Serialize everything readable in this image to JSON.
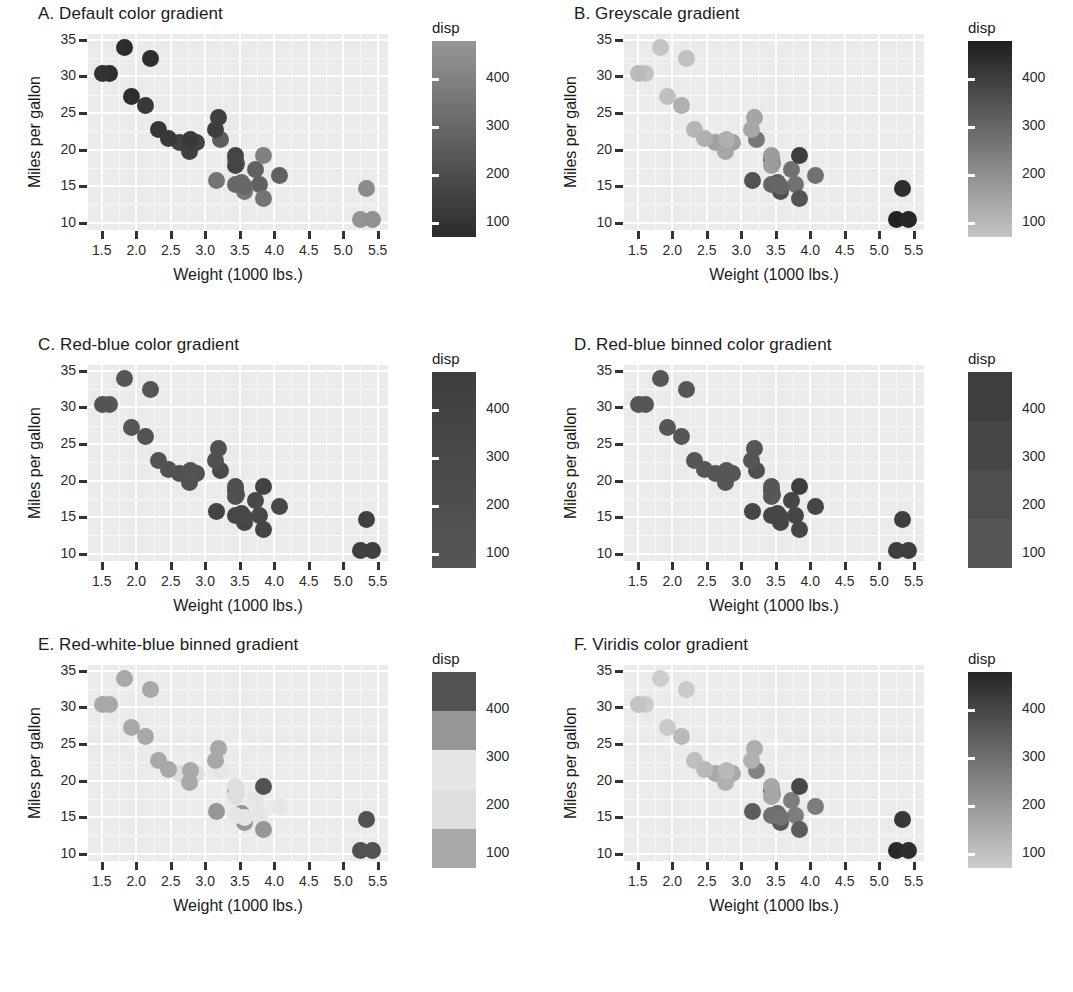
{
  "figure": {
    "axis": {
      "xlabel": "Weight (1000 lbs.)",
      "ylabel": "Miles per gallon",
      "xticks": [
        "1.5",
        "2.0",
        "2.5",
        "3.0",
        "3.5",
        "4.0",
        "4.5",
        "5.0",
        "5.5"
      ],
      "yticks": [
        "10",
        "15",
        "20",
        "25",
        "30",
        "35"
      ],
      "xlim": [
        1.3,
        5.65
      ],
      "ylim": [
        9.0,
        35.8
      ]
    },
    "legend": {
      "title": "disp",
      "labels": [
        "100",
        "200",
        "300",
        "400"
      ],
      "values": [
        100,
        200,
        300,
        400
      ],
      "range": [
        70,
        480
      ]
    },
    "panels": [
      {
        "id": "A",
        "title": "A. Default color gradient",
        "palette": "default-blue",
        "binned": false
      },
      {
        "id": "B",
        "title": "B. Greyscale gradient",
        "palette": "greyscale",
        "binned": false
      },
      {
        "id": "C",
        "title": "C. Red-blue color gradient",
        "palette": "red-blue",
        "binned": false
      },
      {
        "id": "D",
        "title": "D. Red-blue binned color gradient",
        "palette": "red-blue-binned",
        "binned": true
      },
      {
        "id": "E",
        "title": "E. Red-white-blue binned gradient",
        "palette": "red-white-blue-binned",
        "binned": true
      },
      {
        "id": "F",
        "title": "F. Viridis color gradient",
        "palette": "viridis",
        "binned": false
      }
    ]
  },
  "chart_data": {
    "type": "scatter",
    "xlabel": "Weight (1000 lbs.)",
    "ylabel": "Miles per gallon",
    "color_variable": "disp",
    "xlim": [
      1.3,
      5.65
    ],
    "ylim": [
      9.0,
      35.8
    ],
    "grid": true,
    "legend_position": "right",
    "points": [
      {
        "wt": 2.62,
        "mpg": 21.0,
        "disp": 160.0
      },
      {
        "wt": 2.875,
        "mpg": 21.0,
        "disp": 160.0
      },
      {
        "wt": 2.32,
        "mpg": 22.8,
        "disp": 108.0
      },
      {
        "wt": 3.215,
        "mpg": 21.4,
        "disp": 258.0
      },
      {
        "wt": 3.44,
        "mpg": 18.7,
        "disp": 360.0
      },
      {
        "wt": 3.46,
        "mpg": 18.1,
        "disp": 225.0
      },
      {
        "wt": 3.57,
        "mpg": 14.3,
        "disp": 360.0
      },
      {
        "wt": 3.19,
        "mpg": 24.4,
        "disp": 146.7
      },
      {
        "wt": 3.15,
        "mpg": 22.8,
        "disp": 140.8
      },
      {
        "wt": 3.44,
        "mpg": 19.2,
        "disp": 167.6
      },
      {
        "wt": 3.44,
        "mpg": 17.8,
        "disp": 167.6
      },
      {
        "wt": 4.07,
        "mpg": 16.4,
        "disp": 275.8
      },
      {
        "wt": 3.73,
        "mpg": 17.3,
        "disp": 275.8
      },
      {
        "wt": 3.78,
        "mpg": 15.2,
        "disp": 275.8
      },
      {
        "wt": 5.25,
        "mpg": 10.4,
        "disp": 472.0
      },
      {
        "wt": 5.424,
        "mpg": 10.4,
        "disp": 460.0
      },
      {
        "wt": 5.345,
        "mpg": 14.7,
        "disp": 440.0
      },
      {
        "wt": 2.2,
        "mpg": 32.4,
        "disp": 78.7
      },
      {
        "wt": 1.615,
        "mpg": 30.4,
        "disp": 75.7
      },
      {
        "wt": 1.835,
        "mpg": 33.9,
        "disp": 71.1
      },
      {
        "wt": 2.465,
        "mpg": 21.5,
        "disp": 120.1
      },
      {
        "wt": 3.52,
        "mpg": 15.5,
        "disp": 318.0
      },
      {
        "wt": 3.435,
        "mpg": 15.2,
        "disp": 304.0
      },
      {
        "wt": 3.84,
        "mpg": 13.3,
        "disp": 350.0
      },
      {
        "wt": 3.845,
        "mpg": 19.2,
        "disp": 400.0
      },
      {
        "wt": 1.935,
        "mpg": 27.3,
        "disp": 79.0
      },
      {
        "wt": 2.14,
        "mpg": 26.0,
        "disp": 120.3
      },
      {
        "wt": 1.513,
        "mpg": 30.4,
        "disp": 95.1
      },
      {
        "wt": 3.17,
        "mpg": 15.8,
        "disp": 351.0
      },
      {
        "wt": 2.77,
        "mpg": 19.7,
        "disp": 145.0
      },
      {
        "wt": 3.57,
        "mpg": 15.0,
        "disp": 301.0
      },
      {
        "wt": 2.78,
        "mpg": 21.4,
        "disp": 121.0
      }
    ]
  }
}
